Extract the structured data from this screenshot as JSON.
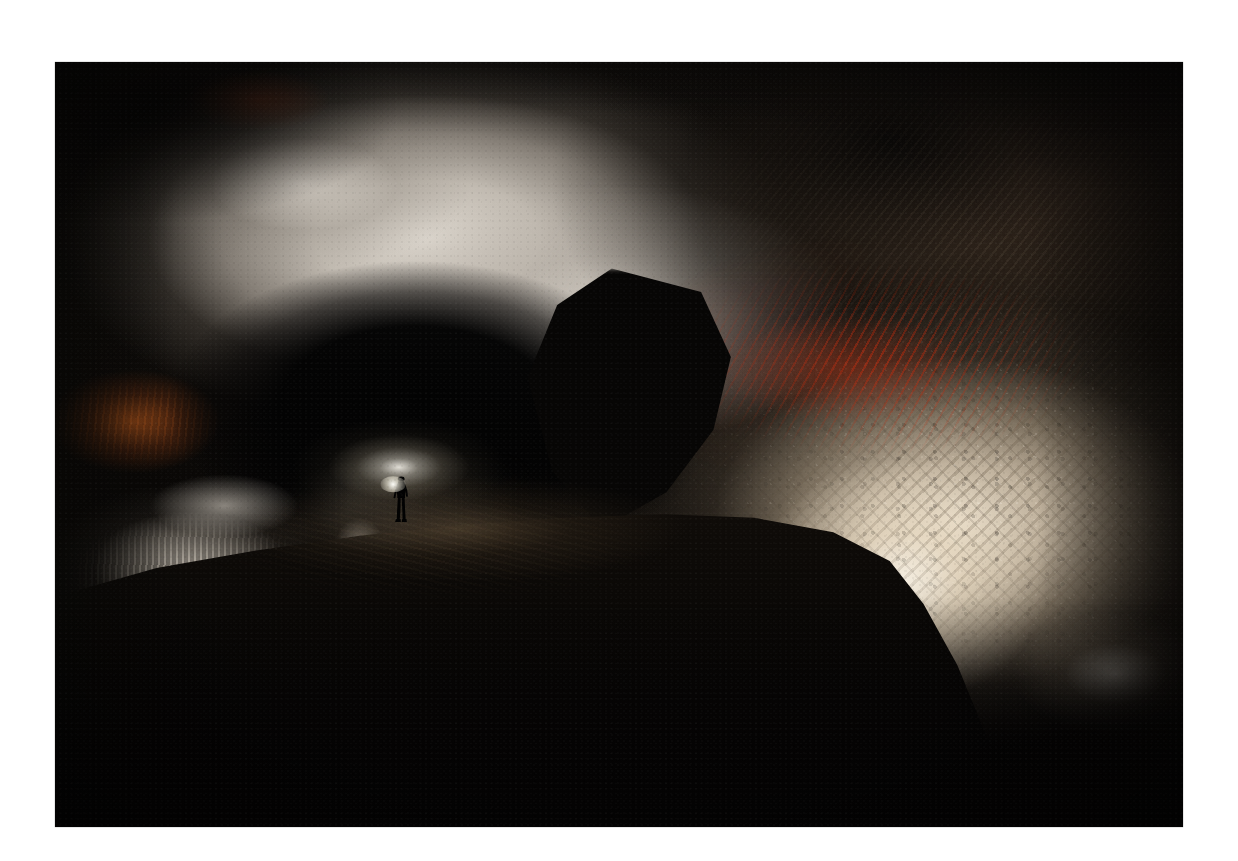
{
  "page": {
    "background_color": "#ffffff",
    "width": 1238,
    "height": 861
  },
  "photo": {
    "kind": "photograph",
    "subject": "cave-interior",
    "caption": "",
    "frame": {
      "left": 55,
      "top": 62,
      "width": 1128,
      "height": 765
    },
    "palette": {
      "background": "#ffffff",
      "deep_shadow": "#050404",
      "cave_black": "#070605",
      "limestone_highlight": "#e2dcd3",
      "warm_wall_highlight": "#faf2e4",
      "warm_wall_mid": "#dec ea e",
      "warm_wall": "#ded0b6",
      "iron_oxide_red": "#d03410",
      "iron_oxide_rust": "#a8200c",
      "orange_stain": "#ba581a",
      "olive_brown_rock": "#3a2c21",
      "floor_brown": "#120e0a",
      "headlamp_glow": "#fffcf4"
    },
    "regions": [
      {
        "name": "ceiling-dome",
        "label": "Bright limestone ceiling dome",
        "tone": "#e2dcd3"
      },
      {
        "name": "right-ceiling",
        "label": "Dark olive-brown textured ceiling",
        "tone": "#3a2c21"
      },
      {
        "name": "red-streaks",
        "label": "Red iron-oxide mineral streaks",
        "tone": "#d03410"
      },
      {
        "name": "left-orange-stain",
        "label": "Orange iron staining on left wall",
        "tone": "#ba581a"
      },
      {
        "name": "right-wall",
        "label": "Illuminated cream scalloped wall",
        "tone": "#ded0b6"
      },
      {
        "name": "central-void",
        "label": "Dark cavern archway / void",
        "tone": "#070605"
      },
      {
        "name": "hanging-boulder",
        "label": "Silhouetted hanging boulder",
        "tone": "#070605"
      },
      {
        "name": "flowstone-ledge",
        "label": "Stalactite and flowstone ledge",
        "tone": "#ccc4b8"
      },
      {
        "name": "floor-ridge",
        "label": "Sloping cave floor ridge",
        "tone": "#120e0a"
      },
      {
        "name": "caver",
        "label": "Lone caver silhouette with headlamp",
        "tone": "#000000"
      },
      {
        "name": "headlamp-glow",
        "label": "Headlamp light bloom",
        "tone": "#fffcf4"
      }
    ]
  }
}
